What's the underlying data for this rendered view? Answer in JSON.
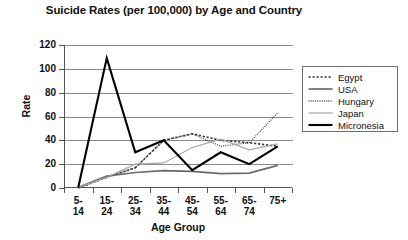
{
  "chart_data": {
    "type": "line",
    "title": "Suicide Rates (per 100,000) by Age and Country",
    "xlabel": "Age Group",
    "ylabel": "Rate",
    "categories": [
      "5-14",
      "15-24",
      "25-34",
      "35-44",
      "45-54",
      "55-64",
      "65-74",
      "75+"
    ],
    "ylim": [
      0,
      120
    ],
    "yticks": [
      0,
      20,
      40,
      60,
      80,
      100,
      120
    ],
    "grid": true,
    "legend_position": "right",
    "series": [
      {
        "name": "Egypt",
        "style": "dotted-coarse",
        "color": "#333333",
        "values": [
          0,
          9,
          17,
          40,
          45.5,
          40,
          38,
          35
        ]
      },
      {
        "name": "USA",
        "style": "solid-medium",
        "color": "#6b6b6b",
        "values": [
          0.5,
          10,
          13,
          14.5,
          14,
          12,
          12.5,
          19
        ]
      },
      {
        "name": "Hungary",
        "style": "dotted-fine",
        "color": "#4a4a4a",
        "values": [
          0,
          9,
          17,
          40,
          45.5,
          35,
          38,
          63
        ]
      },
      {
        "name": "Japan",
        "style": "solid-thin-light",
        "color": "#a8a8a8",
        "values": [
          0.5,
          9,
          20,
          21,
          34,
          41,
          32,
          37
        ]
      },
      {
        "name": "Micronesia",
        "style": "solid-thick",
        "color": "#000000",
        "values": [
          0.5,
          109,
          30,
          40,
          15,
          30,
          20,
          35
        ]
      }
    ]
  },
  "axis": {
    "ytick_labels": [
      "120",
      "100",
      "80",
      "60",
      "40",
      "20",
      "0"
    ],
    "xtick_labels": [
      {
        "line1": "5-",
        "line2": "14"
      },
      {
        "line1": "15-",
        "line2": "24"
      },
      {
        "line1": "25-",
        "line2": "34"
      },
      {
        "line1": "35-",
        "line2": "44"
      },
      {
        "line1": "45-",
        "line2": "54"
      },
      {
        "line1": "55-",
        "line2": "64"
      },
      {
        "line1": "65-",
        "line2": "74"
      },
      {
        "line1": "75+",
        "line2": ""
      }
    ]
  },
  "legend": {
    "items": [
      {
        "label": "Egypt"
      },
      {
        "label": "USA"
      },
      {
        "label": "Hungary"
      },
      {
        "label": "Japan"
      },
      {
        "label": "Micronesia"
      }
    ]
  }
}
